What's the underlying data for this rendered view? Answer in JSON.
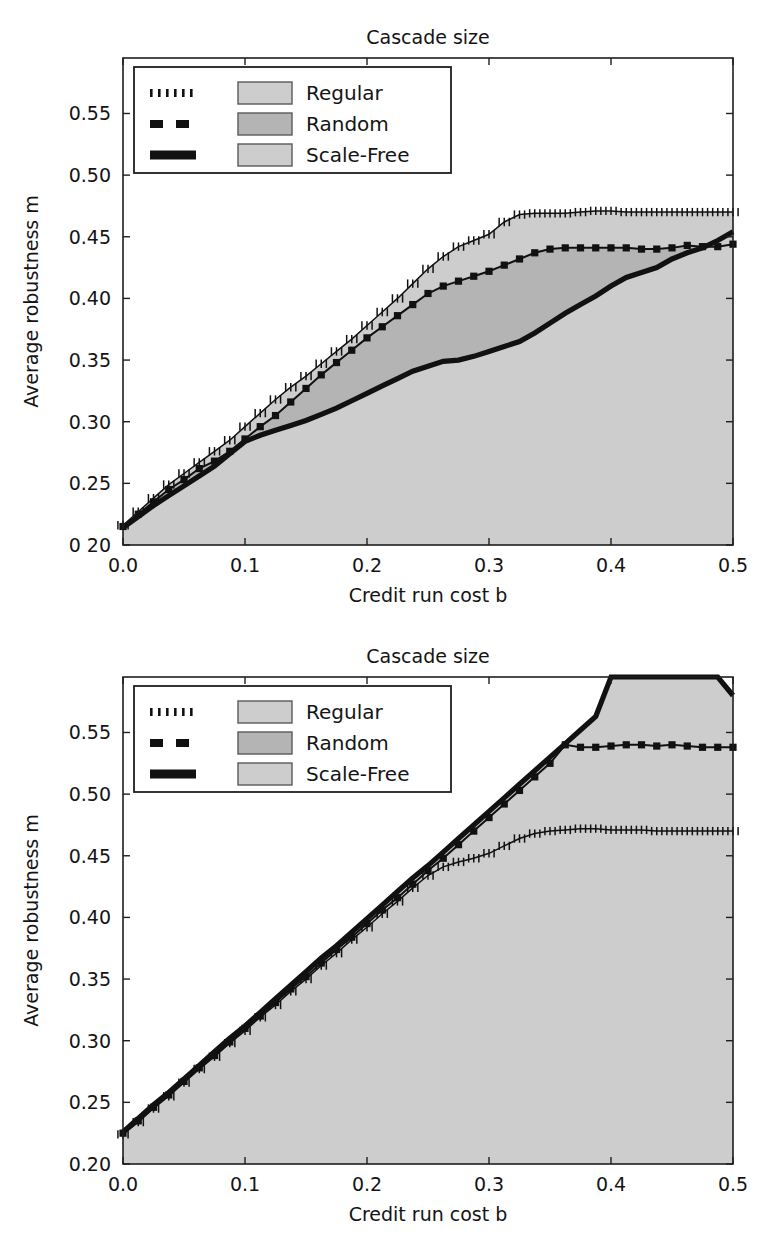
{
  "figure": {
    "panels": [
      {
        "id": "top-panel",
        "title": "Cascade size",
        "xlabel": "Credit run cost b",
        "ylabel": "Average robustness m",
        "xticklabels": [
          "0.0",
          "0.1",
          "0.2",
          "0.3",
          "0.4",
          "0.5"
        ],
        "yticklabels": [
          "0 20",
          "0.25",
          "0.30",
          "0.35",
          "0.40",
          "0.45",
          "0.50",
          "0.55"
        ],
        "legend": {
          "entries": [
            {
              "label": "Regular",
              "linestyle": "dotted",
              "swatch_color": "#cdcdcd"
            },
            {
              "label": "Random",
              "linestyle": "dashed",
              "swatch_color": "#b4b4b4"
            },
            {
              "label": "Scale-Free",
              "linestyle": "solid",
              "swatch_color": "#cdcdcd"
            }
          ]
        }
      },
      {
        "id": "bottom-panel",
        "title": "Cascade size",
        "xlabel": "Credit run cost b",
        "ylabel": "Average robustness m",
        "xticklabels": [
          "0.0",
          "0.1",
          "0.2",
          "0.3",
          "0.4",
          "0.5"
        ],
        "yticklabels": [
          "0.20",
          "0.25",
          "0.30",
          "0.35",
          "0.40",
          "0.45",
          "0.50",
          "0.55"
        ],
        "legend": {
          "entries": [
            {
              "label": "Regular",
              "linestyle": "dotted",
              "swatch_color": "#cdcdcd"
            },
            {
              "label": "Random",
              "linestyle": "dashed",
              "swatch_color": "#b4b4b4"
            },
            {
              "label": "Scale-Free",
              "linestyle": "solid",
              "swatch_color": "#cdcdcd"
            }
          ]
        }
      }
    ]
  },
  "chart_data": [
    {
      "type": "area",
      "title": "Cascade size",
      "xlabel": "Credit run cost b",
      "ylabel": "Average robustness m",
      "xlim": [
        0.0,
        0.5
      ],
      "ylim": [
        0.2,
        0.595
      ],
      "xticks": [
        0.0,
        0.1,
        0.2,
        0.3,
        0.4,
        0.5
      ],
      "yticks": [
        0.2,
        0.25,
        0.3,
        0.35,
        0.4,
        0.45,
        0.5,
        0.55
      ],
      "grid": false,
      "legend_position": "upper-left",
      "x": [
        0.0,
        0.0125,
        0.025,
        0.0375,
        0.05,
        0.0625,
        0.075,
        0.0875,
        0.1,
        0.1125,
        0.125,
        0.1375,
        0.15,
        0.1625,
        0.175,
        0.1875,
        0.2,
        0.2125,
        0.225,
        0.2375,
        0.25,
        0.2625,
        0.275,
        0.2875,
        0.3,
        0.3125,
        0.325,
        0.3375,
        0.35,
        0.3625,
        0.375,
        0.3875,
        0.4,
        0.4125,
        0.425,
        0.4375,
        0.45,
        0.4625,
        0.475,
        0.4875,
        0.5
      ],
      "series": [
        {
          "name": "Regular",
          "linestyle": "dotted",
          "marker": "plus",
          "fill_color": "#cdcdcd",
          "values": [
            0.216,
            0.227,
            0.238,
            0.249,
            0.258,
            0.267,
            0.276,
            0.285,
            0.296,
            0.307,
            0.318,
            0.328,
            0.337,
            0.347,
            0.357,
            0.367,
            0.378,
            0.389,
            0.4,
            0.412,
            0.424,
            0.434,
            0.442,
            0.447,
            0.452,
            0.462,
            0.468,
            0.469,
            0.469,
            0.469,
            0.47,
            0.471,
            0.471,
            0.47,
            0.47,
            0.47,
            0.47,
            0.47,
            0.47,
            0.47,
            0.47
          ]
        },
        {
          "name": "Random",
          "linestyle": "dashed",
          "marker": "square",
          "fill_color": "#b4b4b4",
          "values": [
            0.215,
            0.225,
            0.235,
            0.245,
            0.253,
            0.262,
            0.268,
            0.276,
            0.286,
            0.296,
            0.305,
            0.316,
            0.327,
            0.338,
            0.348,
            0.358,
            0.368,
            0.377,
            0.386,
            0.395,
            0.404,
            0.41,
            0.414,
            0.418,
            0.422,
            0.427,
            0.432,
            0.437,
            0.44,
            0.441,
            0.441,
            0.441,
            0.441,
            0.441,
            0.44,
            0.44,
            0.441,
            0.443,
            0.442,
            0.442,
            0.444
          ]
        },
        {
          "name": "Scale-Free",
          "linestyle": "solid",
          "marker": "none",
          "fill_color": "#cdcdcd",
          "values": [
            0.214,
            0.223,
            0.232,
            0.24,
            0.248,
            0.256,
            0.264,
            0.274,
            0.284,
            0.289,
            0.293,
            0.297,
            0.301,
            0.306,
            0.311,
            0.317,
            0.323,
            0.329,
            0.335,
            0.341,
            0.345,
            0.349,
            0.35,
            0.353,
            0.357,
            0.361,
            0.365,
            0.372,
            0.38,
            0.388,
            0.395,
            0.402,
            0.41,
            0.417,
            0.421,
            0.425,
            0.432,
            0.437,
            0.441,
            0.447,
            0.454
          ]
        }
      ]
    },
    {
      "type": "area",
      "title": "Cascade size",
      "xlabel": "Credit run cost b",
      "ylabel": "Average robustness m",
      "xlim": [
        0.0,
        0.5
      ],
      "ylim": [
        0.2,
        0.595
      ],
      "xticks": [
        0.0,
        0.1,
        0.2,
        0.3,
        0.4,
        0.5
      ],
      "yticks": [
        0.2,
        0.25,
        0.3,
        0.35,
        0.4,
        0.45,
        0.5,
        0.55
      ],
      "grid": false,
      "legend_position": "upper-left",
      "x": [
        0.0,
        0.0125,
        0.025,
        0.0375,
        0.05,
        0.0625,
        0.075,
        0.0875,
        0.1,
        0.1125,
        0.125,
        0.1375,
        0.15,
        0.1625,
        0.175,
        0.1875,
        0.2,
        0.2125,
        0.225,
        0.2375,
        0.25,
        0.2625,
        0.275,
        0.2875,
        0.3,
        0.3125,
        0.325,
        0.3375,
        0.35,
        0.3625,
        0.375,
        0.3875,
        0.4,
        0.4125,
        0.425,
        0.4375,
        0.45,
        0.4625,
        0.475,
        0.4875,
        0.5
      ],
      "series": [
        {
          "name": "Regular",
          "linestyle": "dotted",
          "marker": "plus",
          "fill_color": "#cdcdcd",
          "values": [
            0.224,
            0.234,
            0.245,
            0.255,
            0.266,
            0.277,
            0.287,
            0.298,
            0.308,
            0.319,
            0.329,
            0.34,
            0.35,
            0.361,
            0.371,
            0.382,
            0.392,
            0.403,
            0.413,
            0.424,
            0.434,
            0.441,
            0.445,
            0.448,
            0.452,
            0.458,
            0.464,
            0.468,
            0.47,
            0.471,
            0.472,
            0.472,
            0.471,
            0.471,
            0.471,
            0.47,
            0.47,
            0.47,
            0.47,
            0.47,
            0.47
          ]
        },
        {
          "name": "Random",
          "linestyle": "dashed",
          "marker": "square",
          "fill_color": "#b4b4b4",
          "values": [
            0.225,
            0.235,
            0.246,
            0.256,
            0.267,
            0.278,
            0.288,
            0.299,
            0.31,
            0.32,
            0.331,
            0.342,
            0.352,
            0.363,
            0.374,
            0.384,
            0.395,
            0.406,
            0.416,
            0.427,
            0.438,
            0.448,
            0.459,
            0.47,
            0.481,
            0.492,
            0.503,
            0.514,
            0.525,
            0.54,
            0.538,
            0.538,
            0.539,
            0.54,
            0.54,
            0.539,
            0.54,
            0.539,
            0.538,
            0.538,
            0.538
          ]
        },
        {
          "name": "Scale-Free",
          "linestyle": "solid",
          "marker": "none",
          "fill_color": "#cdcdcd",
          "values": [
            0.226,
            0.237,
            0.248,
            0.258,
            0.269,
            0.28,
            0.291,
            0.302,
            0.312,
            0.323,
            0.334,
            0.345,
            0.356,
            0.367,
            0.377,
            0.388,
            0.399,
            0.41,
            0.421,
            0.432,
            0.442,
            0.453,
            0.464,
            0.475,
            0.486,
            0.497,
            0.508,
            0.519,
            0.53,
            0.541,
            0.552,
            0.563,
            0.595,
            0.595,
            0.595,
            0.595,
            0.595,
            0.595,
            0.595,
            0.595,
            0.58
          ]
        }
      ]
    }
  ]
}
